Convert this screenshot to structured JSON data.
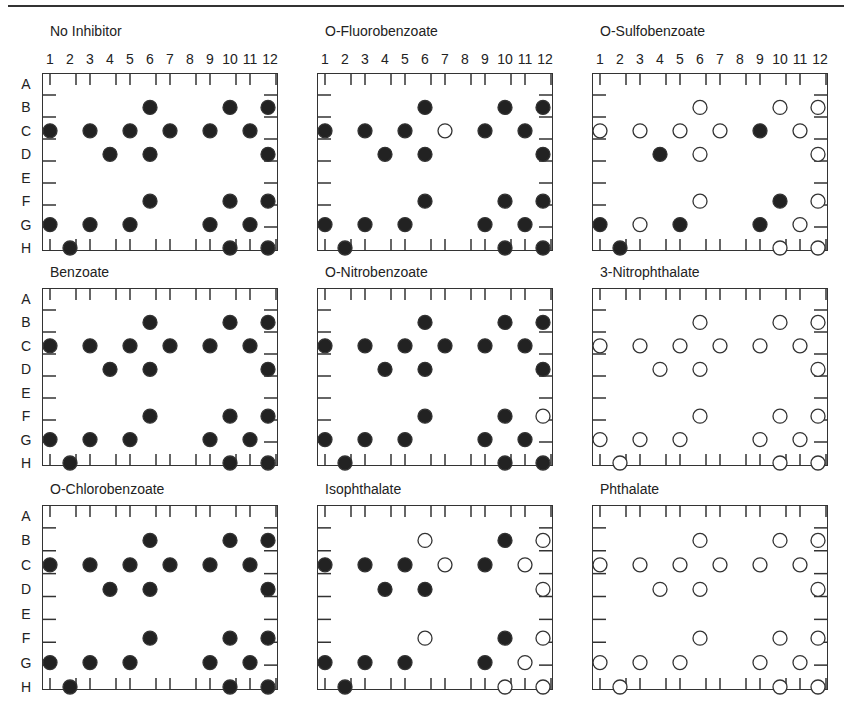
{
  "chart_data": {
    "type": "scatter",
    "rows": [
      "A",
      "B",
      "C",
      "D",
      "E",
      "F",
      "G",
      "H"
    ],
    "columns": [
      "1",
      "2",
      "3",
      "4",
      "5",
      "6",
      "7",
      "8",
      "9",
      "10",
      "11",
      "12"
    ],
    "wells": [
      "B6",
      "B10",
      "B12",
      "C1",
      "C3",
      "C5",
      "C7",
      "C9",
      "C11",
      "D4",
      "D6",
      "D12",
      "F6",
      "F10",
      "F12",
      "G1",
      "G3",
      "G5",
      "G9",
      "G11",
      "H2",
      "H10",
      "H12"
    ],
    "legend": {
      "filled": "positive",
      "open": "negative"
    },
    "panels": [
      {
        "name": "No Inhibitor",
        "open": []
      },
      {
        "name": "O-Fluorobenzoate",
        "open": [
          "C7"
        ]
      },
      {
        "name": "O-Sulfobenzoate",
        "filled": [
          "C9",
          "D4",
          "F10",
          "G1",
          "G5",
          "G9",
          "H2"
        ]
      },
      {
        "name": "Benzoate",
        "open": []
      },
      {
        "name": "O-Nitrobenzoate",
        "open": [
          "F12"
        ]
      },
      {
        "name": "3-Nitrophthalate",
        "filled": []
      },
      {
        "name": "O-Chlorobenzoate",
        "open": []
      },
      {
        "name": "Isophthalate",
        "filled": [
          "B10",
          "C1",
          "C3",
          "C5",
          "C9",
          "D4",
          "D6",
          "F10",
          "G1",
          "G3",
          "G5",
          "G9",
          "H2"
        ]
      },
      {
        "name": "Phthalate",
        "filled": []
      }
    ]
  },
  "colors": {
    "ink": "#222222"
  }
}
